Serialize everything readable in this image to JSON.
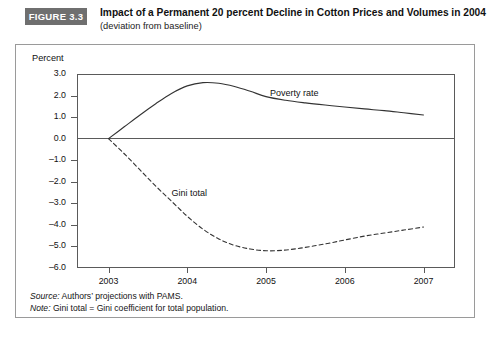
{
  "header": {
    "badge": "FIGURE 3.3",
    "title": "Impact of a Permanent 20 percent Decline in Cotton Prices and Volumes in 2004",
    "subtitle": "(deviation from baseline)"
  },
  "footnotes": {
    "source_key": "Source:",
    "source_text": " Authors’ projections with PAMS.",
    "note_key": "Note:",
    "note_text": " Gini total = Gini coefficient for total population."
  },
  "chart_data": {
    "type": "line",
    "title": "Impact of a Permanent 20 percent Decline in Cotton Prices and Volumes in 2004",
    "subtitle": "(deviation from baseline)",
    "xlabel": "",
    "ylabel": "Percent",
    "xlim": [
      2002.6,
      2007.4
    ],
    "ylim": [
      -6.0,
      3.0
    ],
    "grid": false,
    "legend_position": "inline-annotations",
    "x_ticks": [
      2003,
      2004,
      2005,
      2006,
      2007
    ],
    "x_tick_labels": [
      "2003",
      "2004",
      "2005",
      "2006",
      "2007"
    ],
    "y_ticks": [
      3.0,
      2.0,
      1.0,
      0.0,
      -1.0,
      -2.0,
      -3.0,
      -4.0,
      -5.0,
      -6.0
    ],
    "y_tick_labels": [
      "3.0",
      "2.0",
      "1.0",
      "0.0",
      "–1.0",
      "–2.0",
      "–3.0",
      "–4.0",
      "–5.0",
      "–6.0"
    ],
    "zero_line": 0.0,
    "series": [
      {
        "name": "Poverty rate",
        "style": "solid",
        "color": "#333333",
        "label_x": 2005.05,
        "label_y": 2.05,
        "x": [
          2003.0,
          2003.2,
          2003.4,
          2003.6,
          2003.8,
          2004.0,
          2004.2,
          2004.4,
          2004.6,
          2004.8,
          2005.0,
          2005.25,
          2005.5,
          2005.75,
          2006.0,
          2006.25,
          2006.5,
          2006.75,
          2007.0
        ],
        "values": [
          0.0,
          0.55,
          1.1,
          1.62,
          2.1,
          2.45,
          2.6,
          2.57,
          2.42,
          2.2,
          1.95,
          1.78,
          1.66,
          1.56,
          1.47,
          1.38,
          1.3,
          1.2,
          1.1
        ]
      },
      {
        "name": "Gini total",
        "style": "dashed",
        "color": "#333333",
        "label_x": 2003.8,
        "label_y": -2.55,
        "x": [
          2003.0,
          2003.2,
          2003.4,
          2003.6,
          2003.8,
          2004.0,
          2004.2,
          2004.4,
          2004.6,
          2004.8,
          2005.0,
          2005.2,
          2005.4,
          2005.6,
          2005.8,
          2006.0,
          2006.25,
          2006.5,
          2006.75,
          2007.0
        ],
        "values": [
          0.0,
          -0.7,
          -1.45,
          -2.2,
          -2.9,
          -3.6,
          -4.2,
          -4.65,
          -4.95,
          -5.12,
          -5.2,
          -5.18,
          -5.1,
          -4.98,
          -4.85,
          -4.7,
          -4.52,
          -4.38,
          -4.24,
          -4.1
        ]
      }
    ]
  }
}
